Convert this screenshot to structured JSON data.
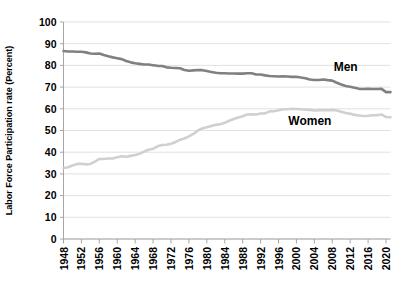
{
  "chart_data": {
    "type": "line",
    "title": "",
    "xlabel": "",
    "ylabel": "Labor Force Participation rate (Percent)",
    "ylim": [
      0,
      100
    ],
    "xlim": [
      1948,
      2021
    ],
    "yticks": [
      0,
      10,
      20,
      30,
      40,
      50,
      60,
      70,
      80,
      90,
      100
    ],
    "xticks": [
      1948,
      1952,
      1956,
      1960,
      1964,
      1968,
      1972,
      1976,
      1980,
      1984,
      1988,
      1992,
      1996,
      2000,
      2004,
      2008,
      2012,
      2016,
      2020
    ],
    "grid": true,
    "legend_position": "inline-annotation",
    "x": [
      1948,
      1949,
      1950,
      1951,
      1952,
      1953,
      1954,
      1955,
      1956,
      1957,
      1958,
      1959,
      1960,
      1961,
      1962,
      1963,
      1964,
      1965,
      1966,
      1967,
      1968,
      1969,
      1970,
      1971,
      1972,
      1973,
      1974,
      1975,
      1976,
      1977,
      1978,
      1979,
      1980,
      1981,
      1982,
      1983,
      1984,
      1985,
      1986,
      1987,
      1988,
      1989,
      1990,
      1991,
      1992,
      1993,
      1994,
      1995,
      1996,
      1997,
      1998,
      1999,
      2000,
      2001,
      2002,
      2003,
      2004,
      2005,
      2006,
      2007,
      2008,
      2009,
      2010,
      2011,
      2012,
      2013,
      2014,
      2015,
      2016,
      2017,
      2018,
      2019,
      2020,
      2021
    ],
    "series": [
      {
        "name": "Men",
        "color": "#808080",
        "label_x": 2011,
        "label_y": 77.5,
        "values": [
          86.6,
          86.4,
          86.4,
          86.3,
          86.3,
          86.0,
          85.5,
          85.4,
          85.5,
          84.8,
          84.2,
          83.7,
          83.3,
          82.9,
          82.0,
          81.4,
          81.0,
          80.7,
          80.4,
          80.4,
          80.1,
          79.8,
          79.7,
          79.1,
          78.9,
          78.8,
          78.7,
          77.9,
          77.5,
          77.7,
          77.9,
          77.8,
          77.4,
          77.0,
          76.6,
          76.4,
          76.4,
          76.3,
          76.3,
          76.2,
          76.2,
          76.4,
          76.4,
          75.8,
          75.8,
          75.4,
          75.1,
          75.0,
          74.9,
          75.0,
          74.9,
          74.7,
          74.8,
          74.4,
          74.1,
          73.5,
          73.3,
          73.3,
          73.5,
          73.2,
          73.0,
          72.0,
          71.2,
          70.5,
          70.2,
          69.7,
          69.2,
          69.1,
          69.2,
          69.1,
          69.1,
          69.2,
          67.7,
          67.7
        ]
      },
      {
        "name": "Women",
        "color": "#d0d0d0",
        "label_x": 2003,
        "label_y": 52.5,
        "values": [
          32.7,
          33.1,
          33.9,
          34.6,
          34.7,
          34.4,
          34.6,
          35.7,
          36.9,
          36.9,
          37.1,
          37.1,
          37.7,
          38.1,
          37.9,
          38.3,
          38.7,
          39.3,
          40.3,
          41.1,
          41.6,
          42.7,
          43.3,
          43.4,
          43.9,
          44.7,
          45.7,
          46.3,
          47.3,
          48.4,
          50.0,
          50.9,
          51.5,
          52.1,
          52.6,
          52.9,
          53.6,
          54.5,
          55.3,
          56.0,
          56.6,
          57.4,
          57.5,
          57.4,
          57.8,
          57.9,
          58.8,
          58.9,
          59.3,
          59.8,
          59.8,
          60.0,
          59.9,
          59.8,
          59.6,
          59.5,
          59.2,
          59.3,
          59.4,
          59.3,
          59.5,
          59.2,
          58.6,
          58.1,
          57.7,
          57.2,
          56.9,
          56.7,
          56.8,
          57.0,
          57.1,
          57.4,
          56.2,
          56.1
        ]
      }
    ]
  }
}
